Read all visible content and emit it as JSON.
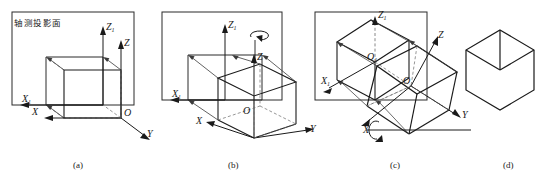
{
  "figure": {
    "title_label": "轴测投影面",
    "panels": [
      {
        "id": "a",
        "caption": "(a)",
        "axis_labels": {
          "z1": "Z",
          "z1_sub": "1",
          "z": "Z",
          "x1": "X",
          "x1_sub": "1",
          "x": "X",
          "y": "Y",
          "o": "O"
        }
      },
      {
        "id": "b",
        "caption": "(b)",
        "axis_labels": {
          "z1": "Z",
          "z1_sub": "1",
          "z": "Z",
          "x1": "X",
          "x1_sub": "1",
          "x": "X",
          "y": "Y",
          "o": "O"
        }
      },
      {
        "id": "c",
        "caption": "(c)",
        "axis_labels": {
          "z1": "Z",
          "z1_sub": "1",
          "z": "Z",
          "x1": "X",
          "x1_sub": "1",
          "x": "X",
          "y": "Y",
          "o1": "O",
          "o1_sub": "1",
          "o": "O"
        }
      },
      {
        "id": "d",
        "caption": "(d)",
        "axis_labels": {}
      }
    ]
  },
  "colors": {
    "line": "#1a1a1a",
    "thin": "#555555",
    "dash": "#6a6a6a",
    "background": "#ffffff"
  }
}
